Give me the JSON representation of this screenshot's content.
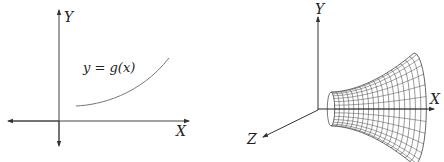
{
  "left_diagram": {
    "axes": {
      "x_label": "X",
      "y_label": "Y"
    },
    "curve_label": "y = g(x)",
    "curve": {
      "description": "increasing convex curve in first quadrant"
    }
  },
  "right_diagram": {
    "axes": {
      "x_label": "X",
      "y_label": "Y",
      "z_label": "Z"
    },
    "surface": {
      "description": "wireframe surface of revolution of g(x) about the X axis",
      "color": "#555555"
    }
  },
  "colors": {
    "axis": "#333333",
    "curve": "#666666",
    "background": "#ffffff"
  }
}
